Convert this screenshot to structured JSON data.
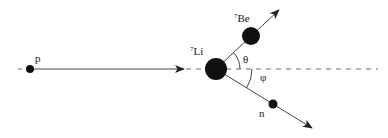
{
  "diagram": {
    "type": "reaction kinematics",
    "labels": {
      "proton": "p",
      "lithium_mass": "7",
      "lithium": "Li",
      "beryllium_mass": "7",
      "beryllium": "Be",
      "neutron": "n",
      "theta": "θ",
      "phi": "φ"
    },
    "colors": {
      "particle": "#111111",
      "line": "#444444",
      "dashed": "#666666"
    }
  }
}
